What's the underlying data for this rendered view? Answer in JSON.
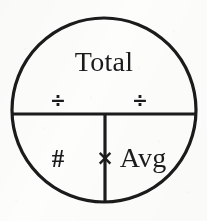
{
  "diagram": {
    "name": "total-count-average-relationship-wheel",
    "type": "divided-circle-mnemonic",
    "stroke_color": "#1b1b1b",
    "background_color": "#fdfdfc",
    "circle": {
      "center_x": 104,
      "center_y": 110,
      "radius": 92,
      "stroke_width": 3
    },
    "dividers": {
      "horizontal_y": 114,
      "vertical_x": 105,
      "stroke_width": 3
    },
    "regions": {
      "top": {
        "label": "Total",
        "name": "total-region"
      },
      "bottom_left": {
        "label": "#",
        "name": "count-region"
      },
      "bottom_right": {
        "label": "Avg",
        "name": "average-region"
      }
    },
    "operators": {
      "divide_left": "÷",
      "divide_right": "÷",
      "multiply": "×"
    }
  }
}
